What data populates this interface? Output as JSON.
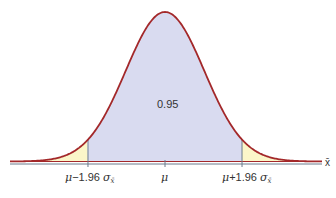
{
  "chart_data": {
    "type": "area",
    "title": "",
    "distribution": "normal",
    "xlabel": "x̄",
    "ylabel": "",
    "mean_label": "μ",
    "lower_label": "μ − 1.96 σ",
    "upper_label": "μ + 1.96 σ",
    "subscript": "x̄",
    "z_critical": 1.96,
    "central_area": 0.95,
    "central_area_label": "0.95",
    "tick_labels": [
      "μ − 1.96 σx̄",
      "μ",
      "μ + 1.96 σx̄"
    ],
    "tick_z": [
      -1.96,
      0,
      1.96
    ],
    "grid": false,
    "colors": {
      "curve": "#a3282a",
      "central_fill": "#d9dbf0",
      "tail_fill": "#fbf6c9",
      "axis": "#6b7a8c",
      "baseline_line": "#a3282a"
    }
  },
  "labels": {
    "area": "0.95",
    "mu": "μ",
    "minus": "−1.96",
    "plus": "+1.96",
    "sigma": "σ",
    "sub": "x̄",
    "axis": "x̄"
  }
}
